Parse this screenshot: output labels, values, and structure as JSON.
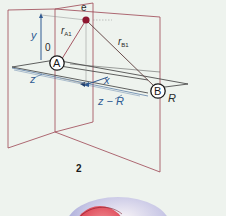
{
  "figure": {
    "number": "2",
    "nodes": {
      "A": {
        "label": "A"
      },
      "B": {
        "label": "B"
      },
      "e": {
        "label": "e"
      }
    },
    "labels": {
      "origin": "0",
      "y_axis": "y",
      "x_axis": "x",
      "z_axis": "z",
      "z_minus_R": "z − R",
      "R": "R",
      "r_A1": "r",
      "r_A1_sub": "A1",
      "r_B1": "r",
      "r_B1_sub": "B1"
    },
    "colors": {
      "plane_edges": "#9c4452",
      "axis_blue": "#2f5a92",
      "electron": "#8e1630",
      "lines": "#3a3a3a",
      "background": "#eef3ee"
    }
  }
}
